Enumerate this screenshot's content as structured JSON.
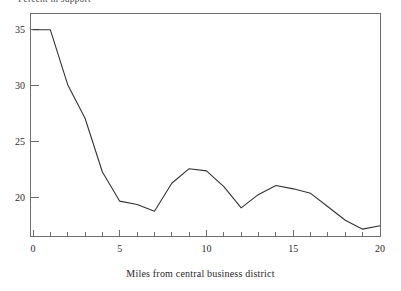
{
  "chart_data": {
    "type": "line",
    "title": "Percent in support",
    "subtitle": "",
    "xlabel": "Miles from central business district",
    "ylabel": "Percent in support",
    "xlim": [
      0,
      20
    ],
    "ylim": [
      16.5,
      36.5
    ],
    "grid": false,
    "legend": false,
    "legend_position": "none",
    "x_major_ticks": [
      0,
      5,
      10,
      15,
      20
    ],
    "x_minor_tick_step": 1,
    "y_major_ticks": [
      20,
      25,
      30,
      35
    ],
    "x_tick_labels": [
      "0",
      "5",
      "10",
      "15",
      "20"
    ],
    "y_tick_labels": [
      "20",
      "25",
      "30",
      "35"
    ],
    "series": [
      {
        "name": "Percent in support",
        "color": "#333333",
        "x": [
          0,
          1,
          2,
          3,
          4,
          5,
          6,
          7,
          8,
          9,
          10,
          11,
          12,
          13,
          14,
          15,
          16,
          17,
          18,
          19,
          20
        ],
        "values": [
          35.0,
          35.0,
          30.1,
          27.1,
          22.3,
          19.7,
          19.4,
          18.8,
          21.3,
          22.6,
          22.4,
          21.0,
          19.1,
          20.3,
          21.1,
          20.8,
          20.4,
          19.2,
          18.0,
          17.2,
          17.5
        ]
      }
    ],
    "annotations": []
  },
  "axis": {
    "x_label_text": "Miles from central business district",
    "y_title_text": "Percent in support"
  }
}
